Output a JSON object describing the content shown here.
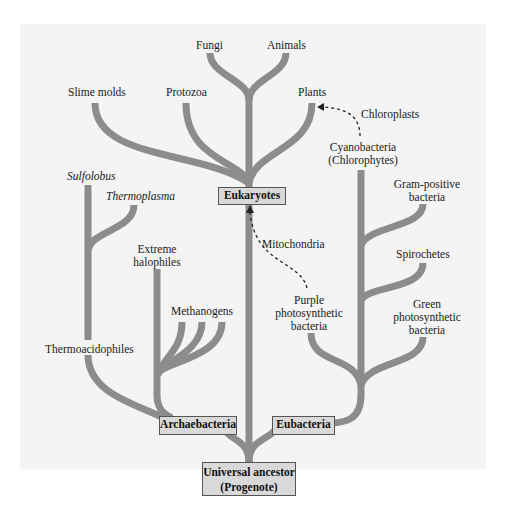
{
  "diagram": {
    "type": "phylogenetic-tree",
    "colors": {
      "background_panel": "#f4f4f4",
      "branch": "#8c8c8c",
      "box_fill": "#d9d9d9",
      "box_border": "#555555"
    },
    "root": {
      "line1": "Universal ancestor",
      "line2": "(Progenote)"
    },
    "domains": {
      "archaebacteria": "Archaebacteria",
      "eubacteria": "Eubacteria",
      "eukaryotes": "Eukaryotes"
    },
    "eukaryote_leaves": {
      "fungi": "Fungi",
      "animals": "Animals",
      "slime_molds": "Slime molds",
      "protozoa": "Protozoa",
      "plants": "Plants"
    },
    "archaea_leaves": {
      "sulfolobus": "Sulfolobus",
      "thermoplasma": "Thermoplasma",
      "thermoacidophiles": "Thermoacidophiles",
      "extreme_halophiles_1": "Extreme",
      "extreme_halophiles_2": "halophiles",
      "methanogens": "Methanogens"
    },
    "bacteria_leaves": {
      "cyanobacteria_1": "Cyanobacteria",
      "cyanobacteria_2": "(Chlorophytes)",
      "gram_positive_1": "Gram-positive",
      "gram_positive_2": "bacteria",
      "spirochetes": "Spirochetes",
      "green_1": "Green",
      "green_2": "photosynthetic",
      "green_3": "bacteria",
      "purple_1": "Purple",
      "purple_2": "photosynthetic",
      "purple_3": "bacteria"
    },
    "endosymbiosis": {
      "chloroplasts": "Chloroplasts",
      "mitochondria": "Mitochondria"
    }
  }
}
